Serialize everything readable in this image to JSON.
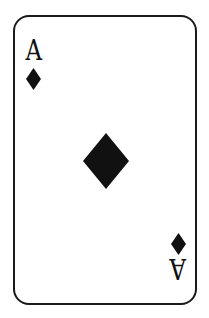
{
  "card": {
    "rank": "A",
    "suit": "diamonds",
    "suit_icon": "diamond-icon",
    "colors": {
      "border": "#1a1a1a",
      "ink": "#111111",
      "background": "#ffffff"
    }
  },
  "corner_top_left": {
    "rank": "A",
    "suit_icon": "diamond-icon"
  },
  "center": {
    "suit_icon": "diamond-icon"
  },
  "corner_bottom_right": {
    "rank": "A",
    "suit_icon": "diamond-icon",
    "rotated": true
  }
}
